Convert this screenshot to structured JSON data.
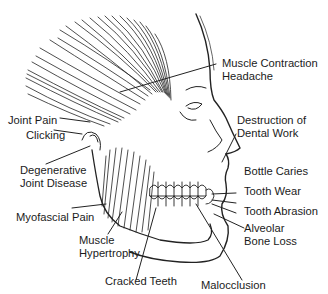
{
  "diagram": {
    "labels": {
      "muscle_contraction_headache": {
        "line1": "Muscle Contraction",
        "line2": "Headache"
      },
      "joint_pain": "Joint Pain",
      "clicking": "Clicking",
      "destruction_dental_work": {
        "line1": "Destruction of",
        "line2": "Dental Work"
      },
      "degenerative_joint_disease": {
        "line1": "Degenerative",
        "line2": "Joint Disease"
      },
      "bottle_caries": "Bottle Caries",
      "tooth_wear": "Tooth Wear",
      "tooth_abrasion": "Tooth Abrasion",
      "myofascial_pain": "Myofascial Pain",
      "alveolar_bone_loss": {
        "line1": "Alveolar",
        "line2": "Bone Loss"
      },
      "muscle_hypertrophy": {
        "line1": "Muscle",
        "line2": "Hypertrophy"
      },
      "cracked_teeth": "Cracked Teeth",
      "malocclusion": "Malocclusion"
    }
  }
}
